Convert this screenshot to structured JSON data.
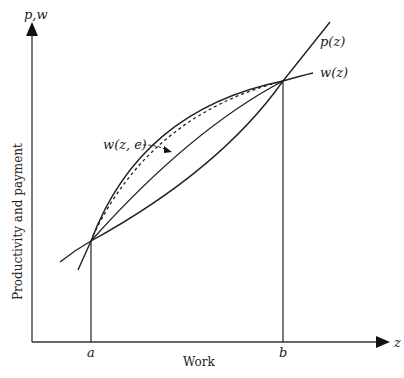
{
  "diagram": {
    "y_axis_label": "p,w",
    "x_axis_label": "z",
    "y_axis_title": "Productivity and payment",
    "x_axis_title": "Work",
    "point_a": "a",
    "point_b": "b",
    "curves": {
      "productivity": "p(z)",
      "payment": "w(z)",
      "payment_eps": "w(z, ϵ)"
    },
    "colors": {
      "line": "#222222",
      "background": "#ffffff"
    }
  }
}
